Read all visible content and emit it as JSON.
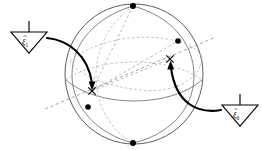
{
  "figure": {
    "name": "sphere-axis-diagram",
    "background_color": "#ffffff"
  },
  "sphere": {
    "center_x": 134,
    "center_y": 74,
    "radius_x": 69,
    "radius_y": 70,
    "outline_color": "#4a4a4a"
  },
  "labels": [
    {
      "id": "pennant-xi-1",
      "symbol": "ξ",
      "subscript": "1",
      "text": "ξ1",
      "accent": "tilde",
      "x": 10,
      "y": 26,
      "width": 38,
      "height": 28,
      "points_to": "marker-left"
    },
    {
      "id": "pennant-xi-0",
      "symbol": "ξ",
      "subscript": "0",
      "text": "ξ0",
      "accent": "tilde",
      "x": 221,
      "y": 99,
      "width": 38,
      "height": 28,
      "points_to": "marker-right"
    }
  ],
  "markers": [
    {
      "id": "marker-left",
      "glyph": "x",
      "x": 92,
      "y": 91
    },
    {
      "id": "marker-right",
      "glyph": "x",
      "x": 170,
      "y": 59
    }
  ],
  "nodes": [
    {
      "id": "node-top",
      "x": 133,
      "y": 6,
      "r": 3.0
    },
    {
      "id": "node-upper-right",
      "x": 178,
      "y": 41,
      "r": 2.8
    },
    {
      "id": "node-lower-left",
      "x": 88,
      "y": 107,
      "r": 2.8
    },
    {
      "id": "node-bottom",
      "x": 133,
      "y": 143,
      "r": 3.0
    }
  ],
  "axis": {
    "id": "rotation-axis",
    "style": "dashed",
    "from_x": 45,
    "from_y": 109,
    "to_x": 216,
    "to_y": 37,
    "color": "#8e8e8e"
  },
  "arrows": [
    {
      "id": "arrow-to-left-marker",
      "from_x": 48,
      "from_y": 39,
      "to_x": 92,
      "to_y": 88,
      "head": "down"
    },
    {
      "id": "arrow-to-right-marker",
      "from_x": 220,
      "from_y": 110,
      "to_x": 171,
      "to_y": 63,
      "head": "up"
    }
  ],
  "colors": {
    "ink": "#000000",
    "sphere_stroke": "#4a4a4a",
    "meridian_solid": "#6e6e6e",
    "meridian_dashed": "#b4b4b4",
    "axis_dashed": "#8e8e8e",
    "background": "#ffffff"
  }
}
